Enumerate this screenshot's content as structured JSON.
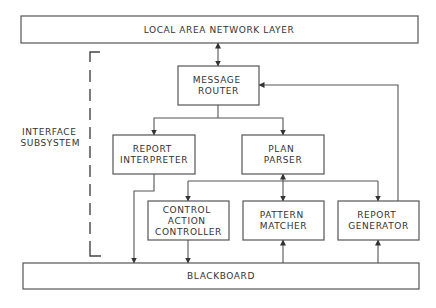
{
  "diagram": {
    "nodes": {
      "lan": {
        "lines": [
          "LOCAL AREA NETWORK LAYER"
        ]
      },
      "router": {
        "lines": [
          "MESSAGE",
          "ROUTER"
        ]
      },
      "interpreter": {
        "lines": [
          "REPORT",
          "INTERPRETER"
        ]
      },
      "parser": {
        "lines": [
          "PLAN",
          "PARSER"
        ]
      },
      "controller": {
        "lines": [
          "CONTROL",
          "ACTION",
          "CONTROLLER"
        ]
      },
      "matcher": {
        "lines": [
          "PATTERN",
          "MATCHER"
        ]
      },
      "generator": {
        "lines": [
          "REPORT",
          "GENERATOR"
        ]
      },
      "blackboard": {
        "lines": [
          "BLACKBOARD"
        ]
      }
    },
    "group_label": {
      "lines": [
        "INTERFACE",
        "SUBSYSTEM"
      ]
    },
    "edges": [
      {
        "from": "lan",
        "to": "router",
        "direction": "both"
      },
      {
        "from": "router",
        "to": "interpreter",
        "direction": "forward"
      },
      {
        "from": "router",
        "to": "parser",
        "direction": "forward"
      },
      {
        "from": "interpreter",
        "to": "blackboard",
        "direction": "forward"
      },
      {
        "from": "parser",
        "to": "controller",
        "direction": "forward"
      },
      {
        "from": "parser",
        "to": "matcher",
        "direction": "both"
      },
      {
        "from": "parser",
        "to": "generator",
        "direction": "forward"
      },
      {
        "from": "controller",
        "to": "blackboard",
        "direction": "forward"
      },
      {
        "from": "blackboard",
        "to": "matcher",
        "direction": "forward"
      },
      {
        "from": "blackboard",
        "to": "generator",
        "direction": "forward"
      },
      {
        "from": "generator",
        "to": "router",
        "direction": "forward"
      }
    ]
  }
}
